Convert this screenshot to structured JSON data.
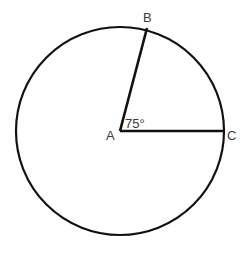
{
  "diagram": {
    "type": "circle-sector-angle",
    "circle": {
      "cx": 120,
      "cy": 131,
      "r": 104,
      "stroke": "#111111"
    },
    "points": {
      "A": {
        "label": "A",
        "x": 120,
        "y": 131
      },
      "B": {
        "label": "B",
        "x": 147,
        "y": 28
      },
      "C": {
        "label": "C",
        "x": 223,
        "y": 131
      }
    },
    "segments": [
      {
        "from": "A",
        "to": "B"
      },
      {
        "from": "A",
        "to": "C"
      }
    ],
    "angle": {
      "vertex": "A",
      "label": "75°",
      "degrees": 75
    }
  }
}
